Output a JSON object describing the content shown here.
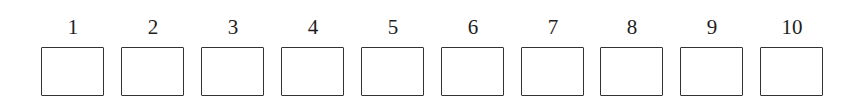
{
  "answer_grid": {
    "cells": [
      {
        "label": "1",
        "value": ""
      },
      {
        "label": "2",
        "value": ""
      },
      {
        "label": "3",
        "value": ""
      },
      {
        "label": "4",
        "value": ""
      },
      {
        "label": "5",
        "value": ""
      },
      {
        "label": "6",
        "value": ""
      },
      {
        "label": "7",
        "value": ""
      },
      {
        "label": "8",
        "value": ""
      },
      {
        "label": "9",
        "value": ""
      },
      {
        "label": "10",
        "value": ""
      }
    ]
  }
}
